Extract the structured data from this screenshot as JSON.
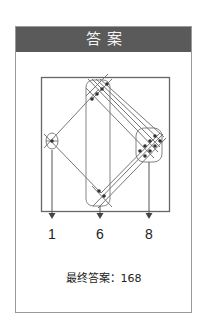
{
  "header": {
    "title": "答案"
  },
  "diagram": {
    "groups": [
      {
        "name": "left",
        "intersections": 1
      },
      {
        "name": "middle",
        "intersections": 6
      },
      {
        "name": "right",
        "intersections": 8
      }
    ]
  },
  "labels": {
    "left": "1",
    "middle": "6",
    "right": "8"
  },
  "answer": {
    "label": "最终答案：",
    "value": "168"
  },
  "colors": {
    "header_bg": "#5a5a5a",
    "line": "#555555",
    "dot": "#333333"
  }
}
